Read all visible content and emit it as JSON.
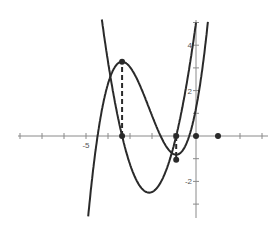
{
  "chart_data": {
    "type": "line",
    "title": "",
    "xlabel": "",
    "ylabel": "",
    "xlim": [
      -8.2,
      3.0
    ],
    "ylim": [
      -3.6,
      5.1
    ],
    "grid": false,
    "x_tick_labels": [
      {
        "value": -5,
        "label": "-5"
      }
    ],
    "y_tick_labels": [
      {
        "value": 4,
        "label": "4"
      },
      {
        "value": 2,
        "label": "2"
      },
      {
        "value": -2,
        "label": "-2"
      }
    ],
    "series": [
      {
        "name": "cubic f(x)",
        "formula": "0.55x^3 + 3.515x^2 + 4.99x + 1.22",
        "coeffs": [
          0.55,
          3.515,
          4.99,
          1.22
        ],
        "x_range": [
          -4.9,
          0.64
        ]
      },
      {
        "name": "derivative f'(x)",
        "formula": "1.65(x+3.36)(x+0.9)",
        "coeffs": [
          0,
          1.65,
          7.029,
          4.99
        ],
        "x_range": [
          -4.3,
          0.0
        ]
      }
    ],
    "markers": [
      {
        "x": -3.36,
        "y": 3.27,
        "type": "dot"
      },
      {
        "x": -3.36,
        "y": 0,
        "type": "dot"
      },
      {
        "x": -0.9,
        "y": 0,
        "type": "dot"
      },
      {
        "x": -0.9,
        "y": -1.05,
        "type": "dot"
      },
      {
        "x": 0,
        "y": 0,
        "type": "dot"
      },
      {
        "x": 1,
        "y": 0,
        "type": "dot"
      }
    ],
    "dashed_lines": [
      {
        "x": -3.36,
        "from": 0,
        "to": 3.27
      },
      {
        "x": -0.9,
        "from": 0,
        "to": -1.05
      }
    ]
  },
  "layout": {
    "origin_px": [
      196,
      136
    ],
    "unit_px_x": 22,
    "unit_px_y": 22.7,
    "x_axis_px": [
      18,
      268
    ],
    "y_axis_px": [
      20,
      218
    ]
  }
}
